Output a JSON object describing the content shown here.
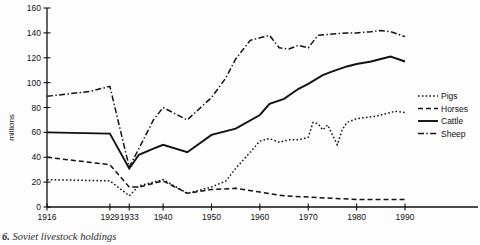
{
  "caption": {
    "number": "6.",
    "text": "Soviet livestock holdings"
  },
  "axes": {
    "ylabel": "millions",
    "yticks": [
      0,
      20,
      40,
      60,
      80,
      100,
      120,
      140,
      160
    ],
    "xticks": [
      1916,
      1929,
      1933,
      1940,
      1950,
      1960,
      1970,
      1980,
      1990
    ],
    "ylim": [
      0,
      160
    ],
    "xlim": [
      1916,
      1990
    ]
  },
  "legend": {
    "position": "right",
    "entries": [
      {
        "label": "Pigs",
        "style": "dotted"
      },
      {
        "label": "Horses",
        "style": "dashed"
      },
      {
        "label": "Cattle",
        "style": "solid"
      },
      {
        "label": "Sheep",
        "style": "dash-dot"
      }
    ]
  },
  "chart_data": {
    "type": "line",
    "title": "Soviet livestock holdings",
    "xlabel": "",
    "ylabel": "millions",
    "ylim": [
      0,
      160
    ],
    "xlim": [
      1916,
      1990
    ],
    "grid": false,
    "legend_position": "right",
    "series": [
      {
        "name": "Pigs",
        "style": "dotted",
        "x": [
          1916,
          1929,
          1933,
          1935,
          1938,
          1940,
          1945,
          1950,
          1953,
          1955,
          1958,
          1960,
          1962,
          1964,
          1966,
          1968,
          1970,
          1971,
          1972,
          1973,
          1974,
          1975,
          1976,
          1977,
          1978,
          1980,
          1982,
          1984,
          1986,
          1988,
          1990
        ],
        "y": [
          22,
          21,
          9,
          17,
          20,
          22,
          11,
          16,
          21,
          31,
          44,
          53,
          55,
          52,
          54,
          54,
          56,
          68,
          67,
          62,
          66,
          58,
          50,
          62,
          68,
          71,
          72,
          73,
          75,
          77,
          76
        ]
      },
      {
        "name": "Horses",
        "style": "dashed",
        "x": [
          1916,
          1929,
          1933,
          1935,
          1940,
          1945,
          1950,
          1955,
          1960,
          1965,
          1970,
          1975,
          1980,
          1985,
          1990
        ],
        "y": [
          40,
          34,
          16,
          16,
          21,
          11,
          14,
          15,
          12,
          9,
          8,
          7,
          6,
          6,
          6
        ]
      },
      {
        "name": "Cattle",
        "style": "solid",
        "x": [
          1916,
          1929,
          1933,
          1935,
          1938,
          1940,
          1945,
          1950,
          1955,
          1960,
          1962,
          1965,
          1968,
          1970,
          1973,
          1975,
          1978,
          1980,
          1983,
          1985,
          1987,
          1990
        ],
        "y": [
          60,
          59,
          31,
          42,
          47,
          50,
          44,
          58,
          63,
          74,
          83,
          87,
          95,
          99,
          106,
          109,
          113,
          115,
          117,
          119,
          121,
          117
        ]
      },
      {
        "name": "Sheep",
        "style": "dash-dot",
        "x": [
          1916,
          1925,
          1929,
          1933,
          1935,
          1938,
          1940,
          1945,
          1950,
          1953,
          1955,
          1958,
          1960,
          1962,
          1964,
          1966,
          1968,
          1970,
          1972,
          1975,
          1978,
          1980,
          1983,
          1985,
          1987,
          1990
        ],
        "y": [
          89,
          93,
          97,
          32,
          47,
          70,
          80,
          70,
          88,
          104,
          119,
          134,
          136,
          138,
          128,
          127,
          130,
          128,
          138,
          139,
          140,
          140,
          141,
          142,
          141,
          137
        ]
      }
    ]
  }
}
